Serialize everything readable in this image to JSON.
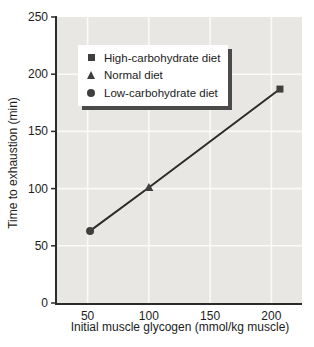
{
  "figure": {
    "background": "#ffffff"
  },
  "chart_data": {
    "type": "scatter",
    "title": "",
    "xlabel": "Initial muscle glycogen (mmol/kg muscle)",
    "ylabel": "Time to exhaustion (min)",
    "xlim": [
      25,
      225
    ],
    "ylim": [
      0,
      250
    ],
    "xticks": [
      50,
      100,
      150,
      200
    ],
    "yticks": [
      0,
      50,
      100,
      150,
      200,
      250
    ],
    "grid": true,
    "legend_position": "top-left",
    "series": [
      {
        "name": "High-carbohydrate diet",
        "marker": "square",
        "points": [
          {
            "x": 207,
            "y": 187
          }
        ]
      },
      {
        "name": "Normal diet",
        "marker": "triangle",
        "points": [
          {
            "x": 100,
            "y": 101
          }
        ]
      },
      {
        "name": "Low-carbohydrate diet",
        "marker": "circle",
        "points": [
          {
            "x": 52,
            "y": 63
          }
        ]
      }
    ],
    "trend_line": {
      "points": [
        {
          "x": 52,
          "y": 63
        },
        {
          "x": 100,
          "y": 101
        },
        {
          "x": 207,
          "y": 187
        }
      ]
    }
  },
  "colors": {
    "plot_background": "#e8e7e4",
    "gridline": "#fafaf7",
    "axis": "#2b2b2b",
    "marker": "#3f3f3f",
    "line": "#2b2b2b",
    "legend_background": "#ffffff",
    "legend_shadow": "#4a4a4a",
    "text": "#1c1c1c"
  }
}
